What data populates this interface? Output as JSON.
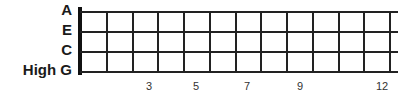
{
  "strings": [
    {
      "label": "A",
      "y": 11
    },
    {
      "label": "E",
      "y": 31
    },
    {
      "label": "C",
      "y": 51
    },
    {
      "label": "High G",
      "y": 71
    }
  ],
  "frets": {
    "count": 12,
    "nut_x": 80,
    "spacing": 25.75
  },
  "fret_markers": [
    {
      "label": "3",
      "x": 149
    },
    {
      "label": "5",
      "x": 196
    },
    {
      "label": "7",
      "x": 247
    },
    {
      "label": "9",
      "x": 300
    },
    {
      "label": "12",
      "x": 382
    }
  ]
}
